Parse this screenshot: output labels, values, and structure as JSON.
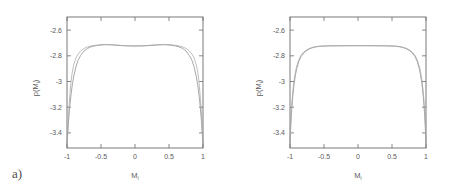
{
  "figure": {
    "panels": [
      {
        "id": "a",
        "label": "a)",
        "xlabel": "M",
        "xlabel_sub": "i",
        "ylabel": "p(M",
        "ylabel_sub": "i",
        "ylabel_close": ")",
        "xticks": [
          "-1",
          "-0.5",
          "0",
          "0.5",
          "1"
        ],
        "yticks": [
          "-2.6",
          "-2.8",
          "-3",
          "-3.2",
          "-3.4"
        ]
      },
      {
        "id": "b",
        "label": "b)",
        "xlabel": "M",
        "xlabel_sub": "i",
        "ylabel": "p(M",
        "ylabel_sub": "i",
        "ylabel_close": ")",
        "xticks": [
          "-1",
          "-0.5",
          "0",
          "0.5",
          "1"
        ],
        "yticks": [
          "-2.6",
          "-2.8",
          "-3",
          "-3.2",
          "-3.4"
        ]
      }
    ],
    "colors": {
      "axis": "#6b6b6b",
      "curve1": "#8a8a8a",
      "curve2": "#a8a8a8",
      "text": "#5a5a5a",
      "background": "#ffffff"
    }
  },
  "chart_data": [
    {
      "type": "line",
      "panel": "a",
      "title": "",
      "xlabel": "M_i",
      "ylabel": "p(M_i)",
      "xlim": [
        -1.0,
        1.0
      ],
      "ylim": [
        -3.52,
        -2.5
      ],
      "xticks": [
        -1,
        -0.5,
        0,
        0.5,
        1
      ],
      "yticks": [
        -2.6,
        -2.8,
        -3.0,
        -3.2,
        -3.4
      ],
      "grid": false,
      "legend": "none",
      "series": [
        {
          "name": "curve-1",
          "x": [
            -1.0,
            -0.98,
            -0.96,
            -0.94,
            -0.92,
            -0.9,
            -0.87,
            -0.84,
            -0.8,
            -0.75,
            -0.7,
            -0.65,
            -0.6,
            -0.55,
            -0.5,
            -0.45,
            -0.4,
            -0.35,
            -0.3,
            -0.25,
            -0.2,
            -0.15,
            -0.1,
            -0.05,
            0.0,
            0.05,
            0.1,
            0.15,
            0.2,
            0.25,
            0.3,
            0.35,
            0.4,
            0.45,
            0.5,
            0.55,
            0.6,
            0.65,
            0.7,
            0.75,
            0.8,
            0.84,
            0.87,
            0.9,
            0.92,
            0.94,
            0.96,
            0.98,
            1.0
          ],
          "y": [
            -3.5,
            -3.33,
            -3.2,
            -3.1,
            -3.02,
            -2.96,
            -2.89,
            -2.84,
            -2.8,
            -2.765,
            -2.745,
            -2.733,
            -2.726,
            -2.721,
            -2.718,
            -2.716,
            -2.716,
            -2.717,
            -2.719,
            -2.721,
            -2.723,
            -2.724,
            -2.725,
            -2.7255,
            -2.726,
            -2.7255,
            -2.725,
            -2.724,
            -2.723,
            -2.721,
            -2.719,
            -2.717,
            -2.716,
            -2.716,
            -2.718,
            -2.721,
            -2.726,
            -2.733,
            -2.745,
            -2.765,
            -2.8,
            -2.84,
            -2.89,
            -2.96,
            -3.02,
            -3.1,
            -3.2,
            -3.33,
            -3.5
          ]
        },
        {
          "name": "curve-2",
          "x": [
            -1.0,
            -0.98,
            -0.96,
            -0.94,
            -0.92,
            -0.9,
            -0.87,
            -0.84,
            -0.8,
            -0.75,
            -0.7,
            -0.65,
            -0.6,
            -0.55,
            -0.5,
            -0.45,
            -0.4,
            -0.35,
            -0.3,
            -0.25,
            -0.2,
            -0.15,
            -0.1,
            -0.05,
            0.0,
            0.05,
            0.1,
            0.15,
            0.2,
            0.25,
            0.3,
            0.35,
            0.4,
            0.45,
            0.5,
            0.55,
            0.6,
            0.65,
            0.7,
            0.75,
            0.8,
            0.84,
            0.87,
            0.9,
            0.92,
            0.94,
            0.96,
            0.98,
            1.0
          ],
          "y": [
            -3.5,
            -3.27,
            -3.12,
            -3.0,
            -2.92,
            -2.87,
            -2.82,
            -2.79,
            -2.765,
            -2.745,
            -2.733,
            -2.726,
            -2.721,
            -2.718,
            -2.715,
            -2.714,
            -2.714,
            -2.715,
            -2.717,
            -2.719,
            -2.721,
            -2.723,
            -2.724,
            -2.7245,
            -2.725,
            -2.7245,
            -2.724,
            -2.723,
            -2.721,
            -2.719,
            -2.717,
            -2.715,
            -2.714,
            -2.714,
            -2.715,
            -2.718,
            -2.721,
            -2.726,
            -2.733,
            -2.745,
            -2.765,
            -2.79,
            -2.82,
            -2.87,
            -2.92,
            -3.0,
            -3.12,
            -3.27,
            -3.5
          ]
        }
      ]
    },
    {
      "type": "line",
      "panel": "b",
      "title": "",
      "xlabel": "M_i",
      "ylabel": "p(M_i)",
      "xlim": [
        -1.0,
        1.0
      ],
      "ylim": [
        -3.52,
        -2.5
      ],
      "xticks": [
        -1,
        -0.5,
        0,
        0.5,
        1
      ],
      "yticks": [
        -2.6,
        -2.8,
        -3.0,
        -3.2,
        -3.4
      ],
      "grid": false,
      "legend": "none",
      "series": [
        {
          "name": "curve-1",
          "x": [
            -1.0,
            -0.99,
            -0.98,
            -0.96,
            -0.94,
            -0.92,
            -0.9,
            -0.87,
            -0.84,
            -0.8,
            -0.76,
            -0.72,
            -0.68,
            -0.64,
            -0.6,
            -0.55,
            -0.5,
            -0.45,
            -0.4,
            -0.3,
            -0.2,
            -0.1,
            0.0,
            0.1,
            0.2,
            0.3,
            0.4,
            0.45,
            0.5,
            0.55,
            0.6,
            0.64,
            0.68,
            0.72,
            0.76,
            0.8,
            0.84,
            0.87,
            0.9,
            0.92,
            0.94,
            0.96,
            0.98,
            0.99,
            1.0
          ],
          "y": [
            -3.5,
            -3.36,
            -3.26,
            -3.12,
            -3.02,
            -2.95,
            -2.9,
            -2.845,
            -2.81,
            -2.781,
            -2.763,
            -2.75,
            -2.741,
            -2.735,
            -2.731,
            -2.728,
            -2.7265,
            -2.7255,
            -2.725,
            -2.7245,
            -2.724,
            -2.7238,
            -2.7237,
            -2.7238,
            -2.724,
            -2.7245,
            -2.725,
            -2.7255,
            -2.7265,
            -2.728,
            -2.731,
            -2.735,
            -2.741,
            -2.75,
            -2.763,
            -2.781,
            -2.81,
            -2.845,
            -2.9,
            -2.95,
            -3.02,
            -3.12,
            -3.26,
            -3.36,
            -3.5
          ]
        },
        {
          "name": "curve-2",
          "x": [
            -1.0,
            -0.99,
            -0.98,
            -0.96,
            -0.94,
            -0.92,
            -0.9,
            -0.87,
            -0.84,
            -0.8,
            -0.76,
            -0.72,
            -0.68,
            -0.64,
            -0.6,
            -0.55,
            -0.5,
            -0.45,
            -0.4,
            -0.3,
            -0.2,
            -0.1,
            0.0,
            0.1,
            0.2,
            0.3,
            0.4,
            0.45,
            0.5,
            0.55,
            0.6,
            0.64,
            0.68,
            0.72,
            0.76,
            0.8,
            0.84,
            0.87,
            0.9,
            0.92,
            0.94,
            0.96,
            0.98,
            0.99,
            1.0
          ],
          "y": [
            -3.5,
            -3.33,
            -3.22,
            -3.08,
            -2.99,
            -2.925,
            -2.88,
            -2.833,
            -2.8,
            -2.774,
            -2.757,
            -2.746,
            -2.738,
            -2.733,
            -2.729,
            -2.7265,
            -2.7253,
            -2.7245,
            -2.724,
            -2.7235,
            -2.7232,
            -2.723,
            -2.7229,
            -2.723,
            -2.7232,
            -2.7235,
            -2.724,
            -2.7245,
            -2.7253,
            -2.7265,
            -2.729,
            -2.733,
            -2.738,
            -2.746,
            -2.757,
            -2.774,
            -2.8,
            -2.833,
            -2.88,
            -2.925,
            -2.99,
            -3.08,
            -3.22,
            -3.33,
            -3.5
          ]
        }
      ]
    }
  ]
}
